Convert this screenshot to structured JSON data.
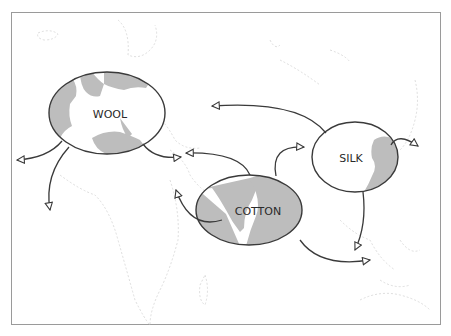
{
  "map": {
    "title": "",
    "colors": {
      "frame": "#9a9a9a",
      "land_outline": "#cfcfcf",
      "shaded_land": "#bdbdbd",
      "ellipse_stroke": "#3a3a3a",
      "ellipse_fill": "#ffffff",
      "arrow": "#3a3a3a",
      "label": "#2a2a2a"
    },
    "regions": [
      {
        "id": "wool",
        "label": "WOOL",
        "area": "Europe / North Africa"
      },
      {
        "id": "cotton",
        "label": "COTTON",
        "area": "India"
      },
      {
        "id": "silk",
        "label": "SILK",
        "area": "China"
      }
    ],
    "arrows": [
      {
        "from": "WOOL",
        "direction": "west"
      },
      {
        "from": "WOOL",
        "direction": "south-west Africa"
      },
      {
        "from": "WOOL",
        "direction": "east"
      },
      {
        "from": "COTTON",
        "direction": "north-west (Middle East)"
      },
      {
        "from": "COTTON",
        "direction": "west (Arabia)"
      },
      {
        "from": "COTTON",
        "direction": "north-east"
      },
      {
        "from": "COTTON",
        "direction": "south-east (Indonesia)"
      },
      {
        "from": "SILK",
        "direction": "west (Central Asia)"
      },
      {
        "from": "SILK",
        "direction": "east (Japan)"
      },
      {
        "from": "SILK",
        "direction": "south (Southeast Asia)"
      }
    ]
  }
}
